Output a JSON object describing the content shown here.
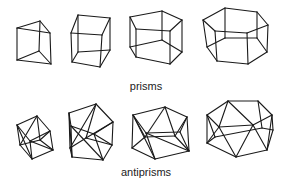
{
  "figure": {
    "rows": [
      {
        "label": "prisms",
        "shapes": [
          {
            "name": "triangular-prism",
            "edges": [
              [
                17,
                28,
                40,
                21
              ],
              [
                40,
                21,
                50,
                33
              ],
              [
                50,
                33,
                17,
                28
              ],
              [
                17,
                28,
                17,
                60
              ],
              [
                50,
                33,
                51,
                64
              ],
              [
                40,
                21,
                39,
                51
              ],
              [
                17,
                60,
                51,
                64
              ],
              [
                17,
                60,
                39,
                51
              ],
              [
                39,
                51,
                51,
                64
              ]
            ]
          },
          {
            "name": "cube",
            "edges": [
              [
                71,
                33,
                78,
                15
              ],
              [
                78,
                15,
                110,
                18
              ],
              [
                110,
                18,
                102,
                35
              ],
              [
                102,
                35,
                71,
                33
              ],
              [
                71,
                33,
                72,
                62
              ],
              [
                102,
                35,
                100,
                67
              ],
              [
                110,
                18,
                110,
                50
              ],
              [
                78,
                15,
                78,
                52
              ],
              [
                72,
                62,
                100,
                67
              ],
              [
                100,
                67,
                110,
                50
              ],
              [
                72,
                62,
                78,
                52
              ],
              [
                78,
                52,
                110,
                50
              ]
            ]
          },
          {
            "name": "pentagonal-prism",
            "edges": [
              [
                130,
                17,
                162,
                11
              ],
              [
                162,
                11,
                182,
                20
              ],
              [
                182,
                20,
                170,
                31
              ],
              [
                170,
                31,
                136,
                29
              ],
              [
                136,
                29,
                130,
                17
              ],
              [
                130,
                17,
                130,
                47
              ],
              [
                136,
                29,
                136,
                57
              ],
              [
                170,
                31,
                170,
                64
              ],
              [
                182,
                20,
                182,
                52
              ],
              [
                162,
                11,
                162,
                40
              ],
              [
                130,
                47,
                136,
                57
              ],
              [
                136,
                57,
                170,
                64
              ],
              [
                170,
                64,
                182,
                52
              ],
              [
                182,
                52,
                162,
                40
              ],
              [
                162,
                40,
                130,
                47
              ]
            ]
          },
          {
            "name": "hexagonal-prism",
            "edges": [
              [
                203,
                20,
                225,
                8
              ],
              [
                225,
                8,
                257,
                12
              ],
              [
                257,
                12,
                268,
                25
              ],
              [
                268,
                25,
                247,
                33
              ],
              [
                247,
                33,
                215,
                31
              ],
              [
                215,
                31,
                203,
                20
              ],
              [
                203,
                20,
                207,
                47
              ],
              [
                215,
                31,
                217,
                61
              ],
              [
                247,
                33,
                248,
                64
              ],
              [
                268,
                25,
                267,
                52
              ],
              [
                257,
                12,
                257,
                38
              ],
              [
                225,
                8,
                225,
                38
              ],
              [
                207,
                47,
                217,
                61
              ],
              [
                217,
                61,
                248,
                64
              ],
              [
                248,
                64,
                267,
                52
              ],
              [
                267,
                52,
                257,
                38
              ],
              [
                257,
                38,
                225,
                38
              ],
              [
                225,
                38,
                207,
                47
              ]
            ]
          }
        ]
      },
      {
        "label": "antiprisms",
        "shapes": [
          {
            "name": "square-antiprism",
            "edges": [
              [
                17,
                125,
                37,
                116
              ],
              [
                37,
                116,
                50,
                131
              ],
              [
                50,
                131,
                30,
                141
              ],
              [
                30,
                141,
                17,
                125
              ],
              [
                20,
                145,
                32,
                159
              ],
              [
                32,
                159,
                53,
                150
              ],
              [
                53,
                150,
                40,
                140
              ],
              [
                40,
                140,
                20,
                145
              ],
              [
                17,
                125,
                20,
                145
              ],
              [
                17,
                125,
                32,
                159
              ],
              [
                30,
                141,
                32,
                159
              ],
              [
                30,
                141,
                53,
                150
              ],
              [
                50,
                131,
                53,
                150
              ],
              [
                50,
                131,
                40,
                140
              ],
              [
                37,
                116,
                40,
                140
              ],
              [
                37,
                116,
                20,
                145
              ]
            ]
          },
          {
            "name": "pentagonal-antiprism",
            "edges": [
              [
                69,
                113,
                96,
                104
              ],
              [
                96,
                104,
                113,
                122
              ],
              [
                113,
                122,
                94,
                134
              ],
              [
                94,
                134,
                71,
                126
              ],
              [
                71,
                126,
                69,
                113
              ],
              [
                72,
                157,
                103,
                160
              ],
              [
                103,
                160,
                112,
                145
              ],
              [
                112,
                145,
                86,
                138
              ],
              [
                86,
                138,
                70,
                148
              ],
              [
                70,
                148,
                72,
                157
              ],
              [
                69,
                113,
                70,
                148
              ],
              [
                69,
                113,
                72,
                157
              ],
              [
                71,
                126,
                72,
                157
              ],
              [
                71,
                126,
                103,
                160
              ],
              [
                94,
                134,
                103,
                160
              ],
              [
                94,
                134,
                112,
                145
              ],
              [
                113,
                122,
                112,
                145
              ],
              [
                113,
                122,
                86,
                138
              ],
              [
                96,
                104,
                86,
                138
              ],
              [
                96,
                104,
                70,
                148
              ]
            ]
          },
          {
            "name": "hexagonal-antiprism",
            "edges": [
              [
                133,
                115,
                165,
                107
              ],
              [
                165,
                107,
                187,
                117
              ],
              [
                187,
                117,
                180,
                132
              ],
              [
                180,
                132,
                146,
                133
              ],
              [
                146,
                133,
                133,
                115
              ],
              [
                132,
                148,
                155,
                159
              ],
              [
                155,
                159,
                189,
                151
              ],
              [
                189,
                151,
                175,
                136
              ],
              [
                175,
                136,
                145,
                137
              ],
              [
                145,
                137,
                132,
                148
              ],
              [
                133,
                115,
                132,
                148
              ],
              [
                133,
                115,
                155,
                159
              ],
              [
                146,
                133,
                155,
                159
              ],
              [
                146,
                133,
                189,
                151
              ],
              [
                180,
                132,
                189,
                151
              ],
              [
                187,
                117,
                189,
                151
              ],
              [
                187,
                117,
                175,
                136
              ],
              [
                165,
                107,
                175,
                136
              ],
              [
                165,
                107,
                145,
                137
              ],
              [
                133,
                115,
                145,
                137
              ]
            ]
          },
          {
            "name": "octagonal-antiprism",
            "edges": [
              [
                207,
                115,
                228,
                101
              ],
              [
                228,
                101,
                258,
                101
              ],
              [
                258,
                101,
                272,
                115
              ],
              [
                272,
                115,
                253,
                125
              ],
              [
                253,
                125,
                219,
                127
              ],
              [
                219,
                127,
                207,
                115
              ],
              [
                207,
                143,
                236,
                157
              ],
              [
                236,
                157,
                267,
                150
              ],
              [
                267,
                150,
                273,
                130
              ],
              [
                273,
                130,
                262,
                128
              ],
              [
                262,
                128,
                215,
                137
              ],
              [
                215,
                137,
                207,
                143
              ],
              [
                207,
                115,
                207,
                143
              ],
              [
                219,
                127,
                207,
                143
              ],
              [
                219,
                127,
                236,
                157
              ],
              [
                253,
                125,
                236,
                157
              ],
              [
                253,
                125,
                267,
                150
              ],
              [
                272,
                115,
                267,
                150
              ],
              [
                272,
                115,
                273,
                130
              ],
              [
                258,
                101,
                262,
                128
              ],
              [
                228,
                101,
                253,
                125
              ],
              [
                228,
                101,
                219,
                127
              ],
              [
                207,
                115,
                215,
                137
              ]
            ]
          }
        ]
      }
    ],
    "labels": {
      "prisms": "prisms",
      "antiprisms": "antiprisms"
    }
  }
}
